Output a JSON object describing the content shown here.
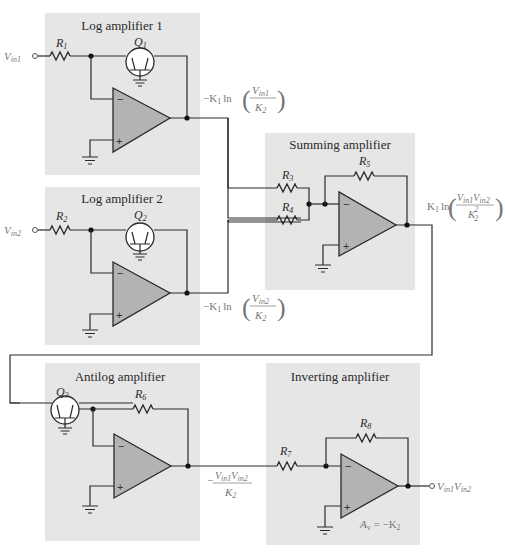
{
  "figure": {
    "type": "circuit-schematic"
  },
  "colors": {
    "panel_background": "#e6e6e6",
    "opamp_fill": "#b3b3b3",
    "wire": "#2a2a2a",
    "expression_text": "#777777"
  },
  "blocks": {
    "log1": {
      "title": "Log amplifier 1",
      "resistor": "R",
      "resistor_sub": "1",
      "transistor": "Q",
      "transistor_sub": "1",
      "input": "V",
      "input_sub": "in1",
      "output_expr": {
        "prefix": "−K",
        "prefix_sub": "1",
        "fn": "ln",
        "num": "V",
        "num_sub": "in1",
        "den": "K",
        "den_sub": "2"
      }
    },
    "log2": {
      "title": "Log amplifier 2",
      "resistor": "R",
      "resistor_sub": "2",
      "transistor": "Q",
      "transistor_sub": "2",
      "input": "V",
      "input_sub": "in2",
      "output_expr": {
        "prefix": "−K",
        "prefix_sub": "1",
        "fn": "ln",
        "num": "V",
        "num_sub": "in2",
        "den": "K",
        "den_sub": "2"
      }
    },
    "summing": {
      "title": "Summing amplifier",
      "r_in_a": "R",
      "r_in_a_sub": "3",
      "r_in_b": "R",
      "r_in_b_sub": "4",
      "r_feedback": "R",
      "r_feedback_sub": "5",
      "output_expr": {
        "prefix": "K",
        "prefix_sub": "1",
        "fn": "ln",
        "num_a": "V",
        "num_a_sub": "in1",
        "num_b": "V",
        "num_b_sub": "in2",
        "den": "K",
        "den_sub": "2",
        "den_sup": "2"
      }
    },
    "antilog": {
      "title": "Antilog amplifier",
      "transistor": "Q",
      "transistor_sub": "3",
      "r_feedback": "R",
      "r_feedback_sub": "6",
      "output_expr": {
        "sign": "−",
        "num_a": "V",
        "num_a_sub": "in1",
        "num_b": "V",
        "num_b_sub": "in2",
        "den": "K",
        "den_sub": "2"
      }
    },
    "inverting": {
      "title": "Inverting amplifier",
      "r_in": "R",
      "r_in_sub": "7",
      "r_feedback": "R",
      "r_feedback_sub": "8",
      "gain_label": "A",
      "gain_sub": "v",
      "gain_value": " = −K",
      "gain_value_sub": "2",
      "output": {
        "a": "V",
        "a_sub": "in1",
        "b": "V",
        "b_sub": "in2"
      }
    }
  },
  "opamp_pins": {
    "inverting": "−",
    "noninverting": "+"
  }
}
